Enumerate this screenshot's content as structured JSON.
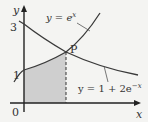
{
  "figure": {
    "axes": {
      "x_label": "x",
      "y_label": "y",
      "origin_label": "0",
      "y_ticks": [
        {
          "label": "3",
          "value": 3
        },
        {
          "label": "1",
          "value": 1
        }
      ]
    },
    "curves": [
      {
        "name": "exp",
        "equation_lhs": "y = e",
        "equation_sup": "x"
      },
      {
        "name": "decay",
        "equation_lhs": "y = 1 + 2e",
        "equation_sup": "−x"
      }
    ],
    "point": {
      "label": "P"
    },
    "shaded_region": "area under y = e^x from x = 0 to x at P",
    "colors": {
      "background": "#f4f4f2",
      "curve": "#3a3a3a",
      "shade": "#cfcfcf",
      "axis": "#222222"
    }
  }
}
